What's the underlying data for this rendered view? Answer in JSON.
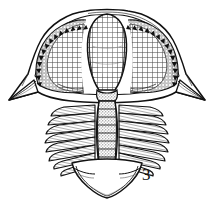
{
  "figure": {
    "label": "3",
    "caption_number": "3",
    "background_color": "#ffffff",
    "ink_color": "#111111",
    "shade_color": "#5a5a5a",
    "width_px": 214,
    "height_px": 203,
    "parts": {
      "cephalon": "cephalon",
      "glabella": "glabella",
      "left_cheek": "left-free-cheek",
      "right_cheek": "right-free-cheek",
      "left_genal_spine": "left-genal-spine",
      "right_genal_spine": "right-genal-spine",
      "marginal_tubercles": "marginal-tubercle-row",
      "thorax": "thorax",
      "axial_lobe": "axial-lobe",
      "left_pleurae": "left-pleural-lobe",
      "right_pleurae": "right-pleural-lobe",
      "pygidium": "pygidium",
      "occipital_ring": "occipital-ring"
    },
    "counts": {
      "thoracic_segments": 9,
      "axial_rings": 9,
      "marginal_tubercles_left": 17,
      "marginal_tubercles_right": 17
    }
  }
}
